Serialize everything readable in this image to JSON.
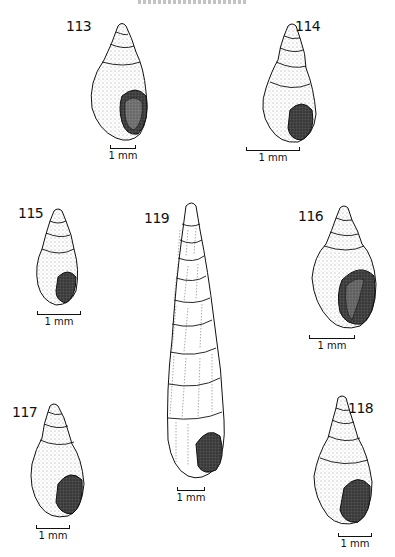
{
  "page": {
    "header_partial": "",
    "figure_type": "plate of gastropod shell illustrations"
  },
  "figures": [
    {
      "number": "113",
      "scale_label": "1 mm"
    },
    {
      "number": "114",
      "scale_label": "1 mm"
    },
    {
      "number": "115",
      "scale_label": "1 mm"
    },
    {
      "number": "119",
      "scale_label": "1 mm"
    },
    {
      "number": "116",
      "scale_label": "1 mm"
    },
    {
      "number": "117",
      "scale_label": "1 mm"
    },
    {
      "number": "118",
      "scale_label": "1 mm"
    }
  ]
}
